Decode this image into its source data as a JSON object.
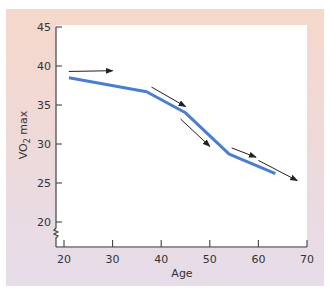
{
  "chart_data": {
    "type": "line",
    "title": "",
    "xlabel": "Age",
    "ylabel": "VO2 max",
    "ylabel_parts": {
      "base": "VO",
      "sub": "2",
      "rest": " max"
    },
    "xlim": [
      20,
      70
    ],
    "ylim": [
      20,
      45
    ],
    "y_axis_break": true,
    "grid": false,
    "legend": null,
    "x_ticks": [
      "20",
      "30",
      "40",
      "50",
      "60",
      "70"
    ],
    "y_ticks": [
      "45",
      "40",
      "35",
      "30",
      "25",
      "20"
    ],
    "series": [
      {
        "name": "VO2 max decline with age",
        "color": "#4a7fd0",
        "x": [
          21,
          37,
          45,
          54,
          63.5
        ],
        "y": [
          38.5,
          36.7,
          34.0,
          28.7,
          26.2
        ]
      }
    ],
    "annotations": [
      {
        "type": "arrow",
        "description": "rate of decline, age ~21-30",
        "from": [
          21,
          39.3
        ],
        "to": [
          30,
          39.4
        ]
      },
      {
        "type": "arrow",
        "description": "rate of decline, age ~38-46",
        "from": [
          38,
          37.3
        ],
        "to": [
          45,
          34.8
        ]
      },
      {
        "type": "arrow",
        "description": "rate of decline, age ~44-50",
        "from": [
          44,
          33.2
        ],
        "to": [
          50,
          29.7
        ]
      },
      {
        "type": "arrow",
        "description": "rate of decline, age ~54-59",
        "from": [
          54.5,
          29.5
        ],
        "to": [
          59.5,
          28.3
        ]
      },
      {
        "type": "arrow",
        "description": "rate of decline, age ~60-68",
        "from": [
          60,
          27.9
        ],
        "to": [
          68,
          25.3
        ]
      }
    ],
    "colors": {
      "line": "#4a7fd0",
      "arrows": "#222222",
      "axes": "#444444",
      "panel_top": "#f6d8cb",
      "panel_bottom": "#e6dde9"
    }
  }
}
